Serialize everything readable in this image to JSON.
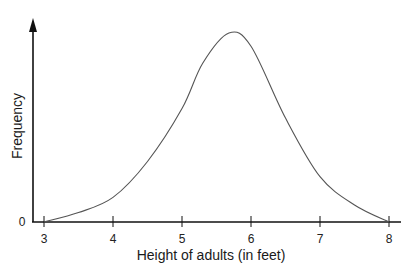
{
  "chart_data": {
    "type": "line",
    "title": "",
    "xlabel": "Height of adults (in feet)",
    "ylabel": "Frequency",
    "x_ticks": [
      "3",
      "4",
      "5",
      "6",
      "7",
      "8"
    ],
    "y_ticks": [
      "0"
    ],
    "xlim": [
      3,
      8
    ],
    "ylim": [
      0,
      1
    ],
    "grid": false,
    "legend": null,
    "series": [
      {
        "name": "Frequency",
        "x": [
          3.0,
          3.5,
          4.0,
          4.5,
          5.0,
          5.3,
          5.68,
          6.0,
          6.5,
          7.0,
          7.5,
          8.0
        ],
        "values": [
          0.0,
          0.05,
          0.13,
          0.32,
          0.6,
          0.84,
          1.0,
          0.93,
          0.55,
          0.24,
          0.09,
          0.0
        ]
      }
    ],
    "peak": {
      "x": 5.68,
      "value": 1.0
    }
  },
  "axes": {
    "x_title": "Height of adults (in feet)",
    "y_title": "Frequency",
    "y_zero_label": "0",
    "x_tick_labels": [
      "3",
      "4",
      "5",
      "6",
      "7",
      "8"
    ]
  },
  "colors": {
    "axis": "#111111",
    "curve": "#555555",
    "text": "#1a1a1a"
  }
}
